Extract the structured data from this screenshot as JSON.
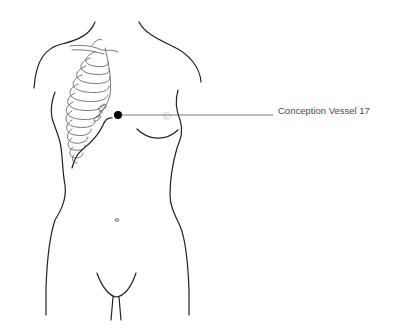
{
  "diagram": {
    "point": {
      "name": "Conception Vessel 17",
      "marker_color": "#000000",
      "x": 118,
      "y": 115
    },
    "label": {
      "text": "Conception Vessel 17",
      "color": "#4a4a4a"
    },
    "leader_line": {
      "color": "#555555",
      "x1": 118,
      "y1": 115,
      "x2": 273,
      "y2": 115
    },
    "outline_color": "#222222",
    "rib_color": "#555555"
  }
}
